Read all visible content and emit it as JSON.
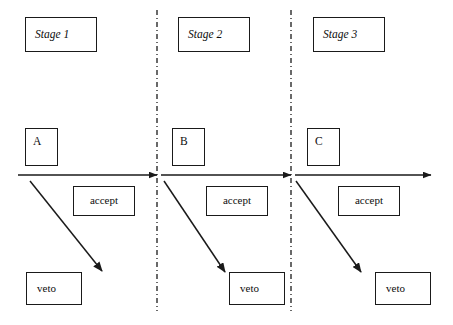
{
  "diagram": {
    "background_color": "#ffffff",
    "line_color": "#1a1a1a",
    "stages": [
      {
        "stage_label": "Stage 1",
        "actor_label": "A",
        "accept_label": "accept",
        "veto_label": "veto"
      },
      {
        "stage_label": "Stage 2",
        "actor_label": "B",
        "accept_label": "accept",
        "veto_label": "veto"
      },
      {
        "stage_label": "Stage 3",
        "actor_label": "C",
        "accept_label": "accept",
        "veto_label": "veto"
      }
    ],
    "dividers": [
      {
        "name": "divider-1",
        "x": 157,
        "style": "dash-dot"
      },
      {
        "name": "divider-2",
        "x": 291,
        "style": "dash-dot"
      }
    ],
    "timeline": {
      "y": 175,
      "segments": [
        {
          "x1": 18,
          "x2": 157
        },
        {
          "x1": 160,
          "x2": 291
        },
        {
          "x1": 294,
          "x2": 430
        }
      ]
    },
    "veto_arrows": [
      {
        "x1": 30,
        "y1": 181,
        "x2": 101,
        "y2": 270
      },
      {
        "x1": 164,
        "y1": 181,
        "x2": 224,
        "y2": 272
      },
      {
        "x1": 296,
        "y1": 181,
        "x2": 360,
        "y2": 272
      }
    ]
  }
}
